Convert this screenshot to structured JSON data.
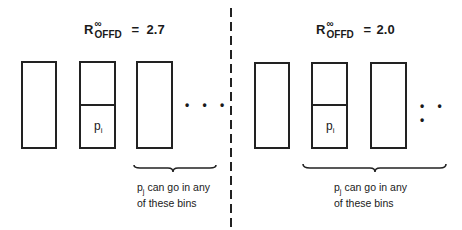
{
  "panels": [
    {
      "title": {
        "symbol": "R",
        "superscript": "∞",
        "subscript": "OFFD",
        "equals": "=",
        "value": "2.7"
      },
      "item_label": {
        "base": "p",
        "subscript": "i"
      },
      "ellipsis": "• • •",
      "note": {
        "base": "p",
        "subscript": "j",
        "line1": "can go in any",
        "line2": "of these bins"
      }
    },
    {
      "title": {
        "symbol": "R",
        "superscript": "∞",
        "subscript": "OFFD",
        "equals": "=",
        "value": "2.0"
      },
      "item_label": {
        "base": "p",
        "subscript": "i"
      },
      "ellipsis": "• • •",
      "note": {
        "base": "p",
        "subscript": "j",
        "line1": "can go in any",
        "line2": "of these bins"
      }
    }
  ],
  "colors": {
    "ink": "#222222",
    "background": "#ffffff"
  }
}
